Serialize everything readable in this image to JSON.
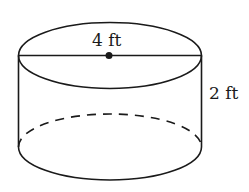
{
  "figure": {
    "type": "cylinder",
    "labels": {
      "diameter": "4 ft",
      "height": "2 ft"
    },
    "colors": {
      "line": "#1a1a1a",
      "background": "#ffffff"
    }
  }
}
